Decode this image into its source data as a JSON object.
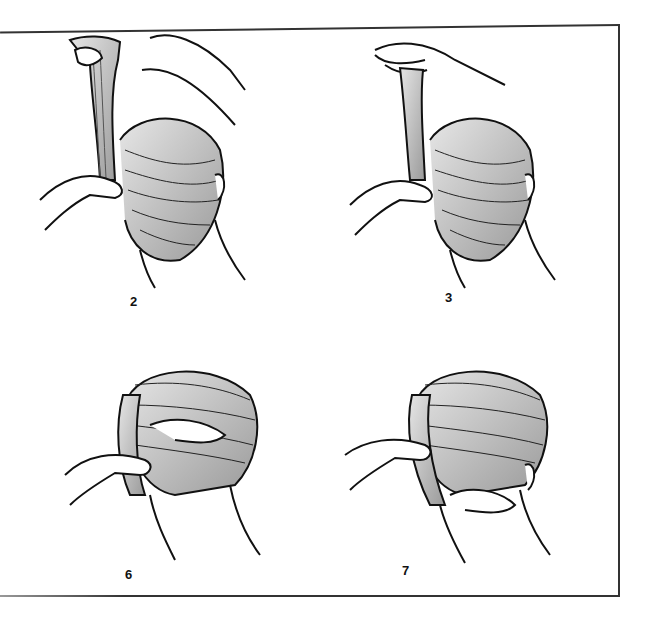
{
  "illustration": {
    "description": "Step-by-step line drawings of styling a French twist hairstyle, viewed from behind the head",
    "panels": [
      {
        "step": "2",
        "action": "hair lifted upward and twisted at the nape"
      },
      {
        "step": "3",
        "action": "twisted hair held up while hand secures base"
      },
      {
        "step": "6",
        "action": "twist rolled and tucked along the back of head"
      },
      {
        "step": "7",
        "action": "twist finished and pinned at the nape"
      }
    ]
  },
  "colors": {
    "line": "#111111",
    "hair_shade": "#bdbdbd",
    "frame": "#333333",
    "background": "#ffffff"
  }
}
